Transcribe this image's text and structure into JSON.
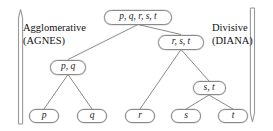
{
  "figure": {
    "background_color": "#ffffff",
    "node_border_color": "#8a8a8a",
    "node_fill_color": "#ffffff",
    "edge_color": "#7d7d7d",
    "text_color": "#1a1a1a",
    "arrow_color": "#9a9a9a"
  },
  "labels": {
    "left": "Agglomerative\n(AGNES)",
    "right": "Divisive\n(DIANA)"
  },
  "arrows": {
    "left": {
      "direction": "up",
      "name": "agglomerative-direction-arrow"
    },
    "right": {
      "direction": "down",
      "name": "divisive-direction-arrow"
    }
  },
  "tree": {
    "nodes": [
      {
        "id": "root",
        "label": "p, q, r, s, t",
        "x": 138,
        "y": 17,
        "w": 68,
        "h": 15,
        "kind": "root"
      },
      {
        "id": "rst",
        "label": "r, s, t",
        "x": 181,
        "y": 42,
        "w": 46,
        "h": 15,
        "kind": "inner"
      },
      {
        "id": "pq",
        "label": "p, q",
        "x": 68,
        "y": 67,
        "w": 36,
        "h": 15,
        "kind": "inner"
      },
      {
        "id": "st",
        "label": "s, t",
        "x": 209,
        "y": 88,
        "w": 33,
        "h": 14,
        "kind": "inner"
      },
      {
        "id": "p",
        "label": "p",
        "x": 44,
        "y": 116,
        "w": 30,
        "h": 14,
        "kind": "leaf"
      },
      {
        "id": "q",
        "label": "q",
        "x": 92,
        "y": 116,
        "w": 30,
        "h": 14,
        "kind": "leaf"
      },
      {
        "id": "r",
        "label": "r",
        "x": 140,
        "y": 116,
        "w": 30,
        "h": 14,
        "kind": "leaf"
      },
      {
        "id": "s",
        "label": "s",
        "x": 186,
        "y": 116,
        "w": 30,
        "h": 14,
        "kind": "leaf"
      },
      {
        "id": "t",
        "label": "t",
        "x": 233,
        "y": 116,
        "w": 30,
        "h": 14,
        "kind": "leaf"
      }
    ],
    "edges": [
      {
        "from": "root",
        "to": "pq"
      },
      {
        "from": "root",
        "to": "rst"
      },
      {
        "from": "pq",
        "to": "p"
      },
      {
        "from": "pq",
        "to": "q"
      },
      {
        "from": "rst",
        "to": "r"
      },
      {
        "from": "rst",
        "to": "st"
      },
      {
        "from": "st",
        "to": "s"
      },
      {
        "from": "st",
        "to": "t"
      }
    ]
  }
}
